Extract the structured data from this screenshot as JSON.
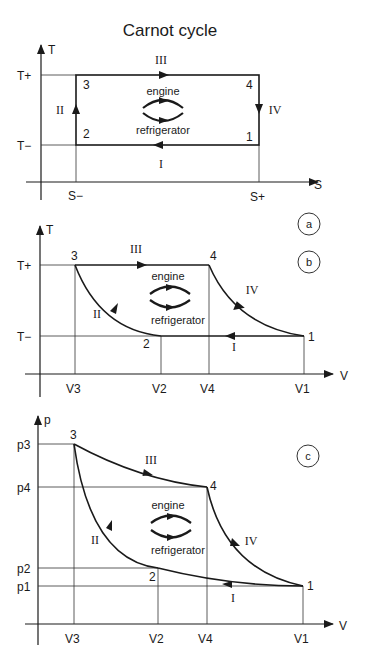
{
  "title": "Carnot cycle",
  "labels": {
    "engine": "engine",
    "refrigerator": "refrigerator"
  },
  "panels": [
    {
      "id": "a",
      "badge": "a",
      "x_axis": "S",
      "y_axis": "T",
      "x_ticks": [
        "S−",
        "S+"
      ],
      "y_ticks": [
        "T+",
        "T−"
      ],
      "points": [
        "1",
        "2",
        "3",
        "4"
      ],
      "processes": [
        "I",
        "II",
        "III",
        "IV"
      ]
    },
    {
      "id": "b",
      "badge": "b",
      "x_axis": "V",
      "y_axis": "T",
      "x_ticks": [
        "V3",
        "V2",
        "V4",
        "V1"
      ],
      "y_ticks": [
        "T+",
        "T−"
      ],
      "points": [
        "1",
        "2",
        "3",
        "4"
      ],
      "processes": [
        "I",
        "II",
        "III",
        "IV"
      ]
    },
    {
      "id": "c",
      "badge": "c",
      "x_axis": "V",
      "y_axis": "p",
      "x_ticks": [
        "V3",
        "V2",
        "V4",
        "V1"
      ],
      "y_ticks": [
        "p3",
        "p4",
        "p2",
        "p1"
      ],
      "points": [
        "1",
        "2",
        "3",
        "4"
      ],
      "processes": [
        "I",
        "II",
        "III",
        "IV"
      ]
    }
  ]
}
